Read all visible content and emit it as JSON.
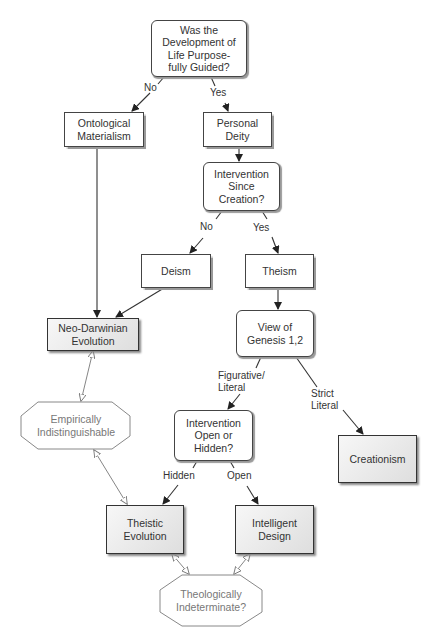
{
  "nodes": {
    "q_guided": {
      "text": "Was the\nDevelopment of\nLife Purpose-\nfully Guided?",
      "shape": "rounded"
    },
    "ontological_materialism": {
      "text": "Ontological\nMaterialism",
      "shape": "rect"
    },
    "personal_deity": {
      "text": "Personal\nDeity",
      "shape": "rect"
    },
    "q_intervention_since": {
      "text": "Intervention\nSince\nCreation?",
      "shape": "rounded"
    },
    "deism": {
      "text": "Deism",
      "shape": "rect"
    },
    "theism": {
      "text": "Theism",
      "shape": "rect"
    },
    "neo_darwinian": {
      "text": "Neo-Darwinian\nEvolution",
      "shape": "shaded-rect"
    },
    "q_genesis": {
      "text": "View of\nGenesis 1,2",
      "shape": "rounded"
    },
    "empirically_indistinguishable": {
      "text": "Empirically\nIndistinguishable",
      "shape": "octagon"
    },
    "q_open_hidden": {
      "text": "Intervention\nOpen or\nHidden?",
      "shape": "rounded"
    },
    "creationism": {
      "text": "Creationism",
      "shape": "shaded-rect"
    },
    "theistic_evolution": {
      "text": "Theistic\nEvolution",
      "shape": "shaded-rect"
    },
    "intelligent_design": {
      "text": "Intelligent\nDesign",
      "shape": "shaded-rect"
    },
    "theologically_indeterminate": {
      "text": "Theologically\nIndeterminate?",
      "shape": "octagon"
    }
  },
  "edge_labels": {
    "no_1": "No",
    "yes_1": "Yes",
    "no_2": "No",
    "yes_2": "Yes",
    "figurative_literal": "Figurative/\nLiteral",
    "strict_literal": "Strict\nLiteral",
    "hidden": "Hidden",
    "open": "Open"
  },
  "edges": [
    {
      "from": "q_guided",
      "to": "ontological_materialism",
      "label": "No"
    },
    {
      "from": "q_guided",
      "to": "personal_deity",
      "label": "Yes"
    },
    {
      "from": "personal_deity",
      "to": "q_intervention_since"
    },
    {
      "from": "q_intervention_since",
      "to": "deism",
      "label": "No"
    },
    {
      "from": "q_intervention_since",
      "to": "theism",
      "label": "Yes"
    },
    {
      "from": "ontological_materialism",
      "to": "neo_darwinian"
    },
    {
      "from": "deism",
      "to": "neo_darwinian"
    },
    {
      "from": "theism",
      "to": "q_genesis"
    },
    {
      "from": "q_genesis",
      "to": "q_open_hidden",
      "label": "Figurative/Literal"
    },
    {
      "from": "q_genesis",
      "to": "creationism",
      "label": "Strict Literal"
    },
    {
      "from": "q_open_hidden",
      "to": "theistic_evolution",
      "label": "Hidden"
    },
    {
      "from": "q_open_hidden",
      "to": "intelligent_design",
      "label": "Open"
    },
    {
      "from": "neo_darwinian",
      "to": "empirically_indistinguishable",
      "style": "double-open-arrow"
    },
    {
      "from": "empirically_indistinguishable",
      "to": "theistic_evolution",
      "style": "double-open-arrow"
    },
    {
      "from": "theistic_evolution",
      "to": "theologically_indeterminate",
      "style": "double-open-arrow"
    },
    {
      "from": "intelligent_design",
      "to": "theologically_indeterminate",
      "style": "double-open-arrow"
    }
  ],
  "colors": {
    "stroke": "#333333",
    "terminal_fill": "#e2e2e2",
    "octagon_text": "#777777"
  }
}
